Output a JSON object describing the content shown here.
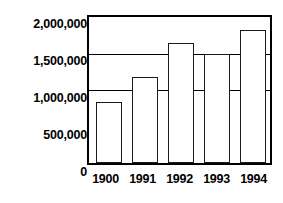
{
  "chart_data": {
    "type": "bar",
    "title": "",
    "xlabel": "",
    "ylabel": "",
    "categories": [
      "1900",
      "1991",
      "1992",
      "1993",
      "1994"
    ],
    "values": [
      830000,
      1180000,
      1650000,
      1500000,
      1820000
    ],
    "ylim": [
      0,
      2000000
    ],
    "ytick_values": [
      0,
      500000,
      1000000,
      1500000,
      2000000
    ],
    "ytick_labels": [
      "0",
      "500,000",
      "1,000,000",
      "1,500,000",
      "2,000,000"
    ],
    "gridlines": [
      1000000,
      1500000
    ],
    "grid": true,
    "legend": null,
    "legend_position": "none",
    "bar_fill_color": "#ffffff",
    "bar_edge_color": "#1a1a1a",
    "axis_color": "#000000",
    "background_color": "#ffffff"
  }
}
